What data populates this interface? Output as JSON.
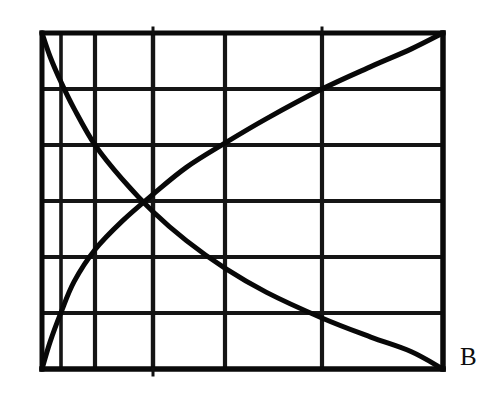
{
  "figure": {
    "background_color": "#ffffff",
    "ink_color": "#0a0a0a",
    "label_b": "B",
    "caption": ""
  },
  "plot_box": {
    "left": 42,
    "top": 33,
    "right": 443,
    "bottom": 369,
    "width": 401,
    "height": 336,
    "border_width": 4.5
  },
  "chart_data": {
    "type": "line",
    "title": "",
    "subtitle": "",
    "xlabel": "",
    "ylabel": "",
    "annotations": [
      "B"
    ],
    "legend": [],
    "legend_position": "none",
    "grid": true,
    "grid_style": "solid",
    "xlim": [
      0,
      1
    ],
    "ylim": [
      0,
      1
    ],
    "x_gridlines_px": [
      42,
      61,
      95,
      153,
      225,
      322,
      443
    ],
    "y_gridlines_px": [
      33,
      89,
      145,
      201,
      257,
      313,
      369
    ],
    "x_gridlines_norm": [
      0.0,
      0.047,
      0.132,
      0.277,
      0.456,
      0.698,
      1.0
    ],
    "y_gridlines_norm": [
      1.0,
      0.833,
      0.667,
      0.5,
      0.333,
      0.167,
      0.0
    ],
    "n_columns": 6,
    "n_rows": 6,
    "crossing_point_px": [
      148,
      207
    ],
    "crossing_point_norm": [
      0.264,
      0.482
    ],
    "series": [
      {
        "name": "decreasing-curve",
        "description": "Convex decreasing exponential-like curve from top-left to bottom-right",
        "color": "#080808",
        "stroke_width": 5,
        "x": [
          0.0,
          0.02,
          0.047,
          0.08,
          0.132,
          0.2,
          0.277,
          0.36,
          0.456,
          0.56,
          0.698,
          0.82,
          0.92,
          1.0
        ],
        "y": [
          1.0,
          0.93,
          0.855,
          0.775,
          0.667,
          0.565,
          0.468,
          0.382,
          0.3,
          0.228,
          0.152,
          0.095,
          0.052,
          0.0
        ]
      },
      {
        "name": "increasing-curve",
        "description": "Concave increasing exponential-like curve from bottom-left to top-right",
        "color": "#080808",
        "stroke_width": 5,
        "x": [
          0.0,
          0.02,
          0.047,
          0.08,
          0.132,
          0.2,
          0.277,
          0.36,
          0.456,
          0.56,
          0.698,
          0.82,
          0.92,
          1.0
        ],
        "y": [
          0.0,
          0.08,
          0.167,
          0.26,
          0.355,
          0.44,
          0.52,
          0.6,
          0.672,
          0.745,
          0.833,
          0.9,
          0.952,
          1.0
        ]
      }
    ],
    "values": [],
    "categories": []
  }
}
